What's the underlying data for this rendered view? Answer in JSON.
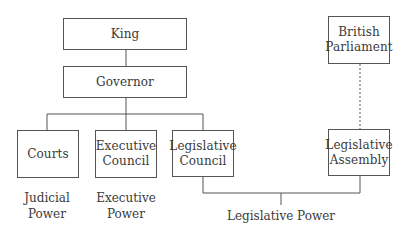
{
  "diagram": {
    "type": "organizational-chart",
    "nodes": {
      "king": "King",
      "governor": "Governor",
      "courts": "Courts",
      "executive_council": "Executive\nCouncil",
      "legislative_council": "Legislative\nCouncil",
      "british_parliament": "British\nParliament",
      "legislative_assembly": "Legislative\nAssembly"
    },
    "labels": {
      "judicial_power": "Judicial\nPower",
      "executive_power": "Executive\nPower",
      "legislative_power": "Legislative Power"
    },
    "edges": [
      {
        "from": "King",
        "to": "Governor",
        "style": "solid"
      },
      {
        "from": "Governor",
        "to": "Courts",
        "style": "solid"
      },
      {
        "from": "Governor",
        "to": "Executive Council",
        "style": "solid"
      },
      {
        "from": "Governor",
        "to": "Legislative Council",
        "style": "solid"
      },
      {
        "from": "British Parliament",
        "to": "Legislative Assembly",
        "style": "dotted"
      },
      {
        "from": "Legislative Council",
        "to": "Legislative Power",
        "style": "solid"
      },
      {
        "from": "Legislative Assembly",
        "to": "Legislative Power",
        "style": "solid"
      }
    ],
    "colors": {
      "line": "#555555",
      "text": "#3a3a3a",
      "background": "#ffffff"
    }
  }
}
